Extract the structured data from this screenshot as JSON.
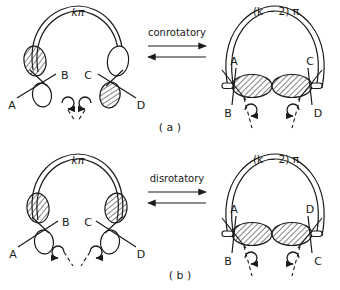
{
  "figure": {
    "type": "chemistry-orbital-diagram",
    "width": 340,
    "height": 290,
    "background": "#ffffff",
    "ink": "#1a1a1a"
  },
  "rows": [
    {
      "id": "a",
      "caption": "( a )",
      "process_label": "conrotatory",
      "reactant": {
        "ring_label": "kπ",
        "substituents": [
          "A",
          "B",
          "C",
          "D"
        ],
        "left_terminus": {
          "top_lobe": "shaded",
          "bottom_lobe": "open",
          "labels": [
            "B",
            "A"
          ]
        },
        "right_terminus": {
          "top_lobe": "open",
          "bottom_lobe": "shaded",
          "labels": [
            "C",
            "D"
          ]
        },
        "rotation": [
          "clockwise",
          "counterclockwise"
        ]
      },
      "product": {
        "ring_label": "(k − 2) π",
        "substituents": [
          "A",
          "B",
          "C",
          "D"
        ],
        "sigma_bond_lobes": [
          "shaded",
          "shaded"
        ],
        "left_terminus": {
          "labels": [
            "A",
            "B"
          ]
        },
        "right_terminus": {
          "labels": [
            "C",
            "D"
          ]
        },
        "rotation": [
          "clockwise",
          "counterclockwise"
        ]
      }
    },
    {
      "id": "b",
      "caption": "( b )",
      "process_label": "disrotatory",
      "reactant": {
        "ring_label": "kπ",
        "substituents": [
          "A",
          "B",
          "C",
          "D"
        ],
        "left_terminus": {
          "top_lobe": "shaded",
          "bottom_lobe": "open",
          "labels": [
            "B",
            "A"
          ]
        },
        "right_terminus": {
          "top_lobe": "shaded",
          "bottom_lobe": "open",
          "labels": [
            "C",
            "D"
          ]
        },
        "rotation": [
          "counterclockwise",
          "clockwise"
        ]
      },
      "product": {
        "ring_label": "(k − 2) π",
        "substituents": [
          "A",
          "B",
          "C",
          "D"
        ],
        "sigma_bond_lobes": [
          "shaded",
          "shaded"
        ],
        "left_terminus": {
          "labels": [
            "A",
            "B"
          ]
        },
        "right_terminus": {
          "labels": [
            "D",
            "C"
          ]
        },
        "rotation": [
          "clockwise",
          "counterclockwise"
        ]
      }
    }
  ]
}
